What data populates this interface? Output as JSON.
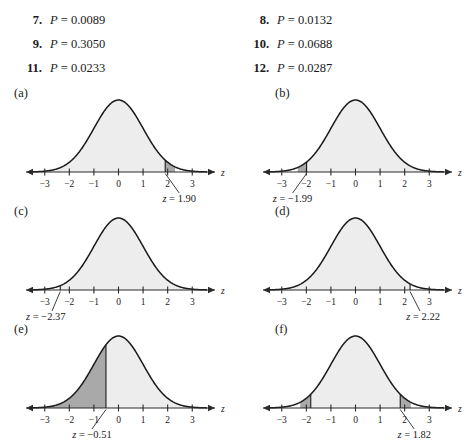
{
  "answers": {
    "rows": [
      {
        "left": {
          "number": "7.",
          "label": "P",
          "eq": "=",
          "value": "0.0089"
        },
        "right": {
          "number": "8.",
          "label": "P",
          "eq": "=",
          "value": "0.0132"
        }
      },
      {
        "left": {
          "number": "9.",
          "label": "P",
          "eq": "=",
          "value": "0.3050"
        },
        "right": {
          "number": "10.",
          "label": "P",
          "eq": "=",
          "value": "0.0688"
        }
      },
      {
        "left": {
          "number": "11.",
          "label": "P",
          "eq": "=",
          "value": "0.0233"
        },
        "right": {
          "number": "12.",
          "label": "P",
          "eq": "=",
          "value": "0.0287"
        }
      }
    ]
  },
  "chart_data": [
    {
      "id": "a",
      "panel": "(a)",
      "type": "area",
      "title": "",
      "xlabel": "z",
      "ylabel": "",
      "xlim": [
        -3.6,
        3.6
      ],
      "ylim": [
        0,
        0.42
      ],
      "grid": false,
      "curve": "standard normal density",
      "ticks": [
        -3,
        -2,
        -1,
        0,
        1,
        2,
        3
      ],
      "tick_labels": [
        "−3",
        "−2",
        "−1",
        "0",
        "1",
        "2",
        "3"
      ],
      "annotation": "z = 1.90",
      "annotation_z_value": 1.9,
      "annotation_side": "right",
      "shaded_regions": [
        {
          "from": -3.6,
          "to": 1.9,
          "shade": "light"
        },
        {
          "from": 1.9,
          "to": 2.3,
          "shade": "dark"
        }
      ],
      "marker_z": 1.9
    },
    {
      "id": "b",
      "panel": "(b)",
      "type": "area",
      "title": "",
      "xlabel": "z",
      "ylabel": "",
      "xlim": [
        -3.6,
        3.6
      ],
      "ylim": [
        0,
        0.42
      ],
      "grid": false,
      "curve": "standard normal density",
      "ticks": [
        -3,
        -2,
        -1,
        0,
        1,
        2,
        3
      ],
      "tick_labels": [
        "−3",
        "−2",
        "−1",
        "0",
        "1",
        "2",
        "3"
      ],
      "annotation": "z = −1.99",
      "annotation_z_value": -1.99,
      "annotation_side": "left",
      "shaded_regions": [
        {
          "from": -2.35,
          "to": -1.99,
          "shade": "dark"
        },
        {
          "from": -1.99,
          "to": 3.6,
          "shade": "light"
        }
      ],
      "marker_z": -1.99
    },
    {
      "id": "c",
      "panel": "(c)",
      "type": "area",
      "title": "",
      "xlabel": "z",
      "ylabel": "",
      "xlim": [
        -3.6,
        3.6
      ],
      "ylim": [
        0,
        0.42
      ],
      "grid": false,
      "curve": "standard normal density",
      "ticks": [
        -3,
        -2,
        -1,
        0,
        1,
        2,
        3
      ],
      "tick_labels": [
        "−3",
        "−2",
        "−1",
        "0",
        "1",
        "2",
        "3"
      ],
      "annotation": "z = −2.37",
      "annotation_z_value": -2.37,
      "annotation_side": "left",
      "shaded_regions": [
        {
          "from": -2.37,
          "to": 3.6,
          "shade": "light"
        }
      ],
      "marker_z": -2.37
    },
    {
      "id": "d",
      "panel": "(d)",
      "type": "area",
      "title": "",
      "xlabel": "z",
      "ylabel": "",
      "xlim": [
        -3.6,
        3.6
      ],
      "ylim": [
        0,
        0.42
      ],
      "grid": false,
      "curve": "standard normal density",
      "ticks": [
        -3,
        -2,
        -1,
        0,
        1,
        2,
        3
      ],
      "tick_labels": [
        "−3",
        "−2",
        "−1",
        "0",
        "1",
        "2",
        "3"
      ],
      "annotation": "z = 2.22",
      "annotation_z_value": 2.22,
      "annotation_side": "right",
      "shaded_regions": [
        {
          "from": -3.6,
          "to": 2.22,
          "shade": "light"
        }
      ],
      "marker_z": 2.22
    },
    {
      "id": "e",
      "panel": "(e)",
      "type": "area",
      "title": "",
      "xlabel": "z",
      "ylabel": "",
      "xlim": [
        -3.6,
        3.6
      ],
      "ylim": [
        0,
        0.42
      ],
      "grid": false,
      "curve": "standard normal density",
      "ticks": [
        -3,
        -2,
        -1,
        0,
        1,
        2,
        3
      ],
      "tick_labels": [
        "−3",
        "−2",
        "−1",
        "0",
        "1",
        "2",
        "3"
      ],
      "annotation": "z = −0.51",
      "annotation_z_value": -0.51,
      "annotation_side": "left",
      "shaded_regions": [
        {
          "from": -3.6,
          "to": -0.51,
          "shade": "dark"
        },
        {
          "from": -0.51,
          "to": 3.6,
          "shade": "light"
        }
      ],
      "marker_z": -0.51
    },
    {
      "id": "f",
      "panel": "(f)",
      "type": "area",
      "title": "",
      "xlabel": "z",
      "ylabel": "",
      "xlim": [
        -3.6,
        3.6
      ],
      "ylim": [
        0,
        0.42
      ],
      "grid": false,
      "curve": "standard normal density",
      "ticks": [
        -3,
        -2,
        -1,
        0,
        1,
        2,
        3
      ],
      "tick_labels": [
        "−3",
        "−2",
        "−1",
        "0",
        "1",
        "2",
        "3"
      ],
      "annotation": "z = 1.82",
      "annotation_z_value": 1.82,
      "annotation_side": "right",
      "shaded_regions": [
        {
          "from": -2.25,
          "to": -1.82,
          "shade": "dark"
        },
        {
          "from": -1.82,
          "to": 1.82,
          "shade": "light"
        },
        {
          "from": 1.82,
          "to": 2.25,
          "shade": "dark"
        }
      ],
      "marker_z": 1.82,
      "marker_z2": -1.82
    }
  ],
  "style": {
    "curve_color": "#1a1a1a",
    "light_fill": "#ededed",
    "dark_fill": "#a9a9a9",
    "axis_color": "#2a2a2a",
    "background": "#ffffff"
  }
}
